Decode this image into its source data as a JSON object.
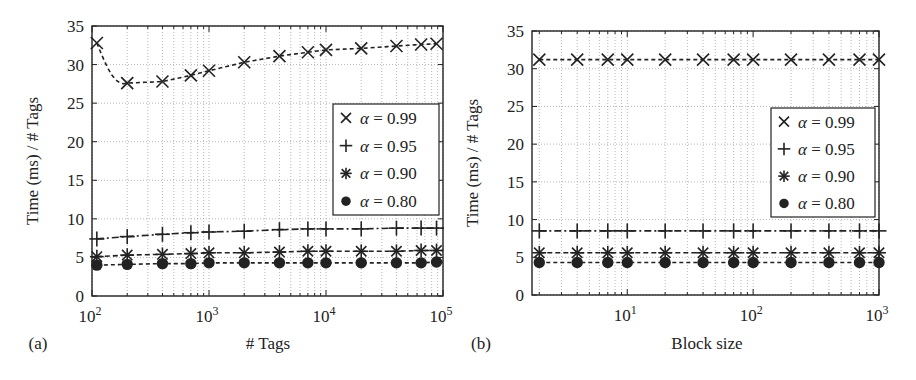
{
  "chart_data": [
    {
      "type": "line",
      "panel_label": "(a)",
      "title": "",
      "xlabel": "# Tags",
      "ylabel": "Time (ms) / # Tags",
      "xscale": "log",
      "xlim": [
        100,
        100000
      ],
      "ylim": [
        0,
        35
      ],
      "xticks": [
        100,
        1000,
        10000,
        100000
      ],
      "xtick_labels": [
        {
          "base": "10",
          "exp": "2"
        },
        {
          "base": "10",
          "exp": "3"
        },
        {
          "base": "10",
          "exp": "4"
        },
        {
          "base": "10",
          "exp": "5"
        }
      ],
      "yticks": [
        0,
        5,
        10,
        15,
        20,
        25,
        30,
        35
      ],
      "grid": true,
      "legend_position": "center-right",
      "x": [
        110,
        200,
        400,
        700,
        1000,
        2000,
        4000,
        7000,
        10000,
        20000,
        40000,
        65000,
        88000
      ],
      "series": [
        {
          "name": "α = 0.99",
          "alpha": "0.99",
          "marker": "x",
          "values": [
            32.8,
            27.6,
            27.8,
            28.6,
            29.2,
            30.3,
            31.1,
            31.6,
            31.9,
            32.1,
            32.4,
            32.6,
            32.7
          ]
        },
        {
          "name": "α = 0.95",
          "alpha": "0.95",
          "marker": "plus",
          "values": [
            7.4,
            7.7,
            8.0,
            8.2,
            8.3,
            8.4,
            8.6,
            8.7,
            8.7,
            8.7,
            8.8,
            8.8,
            8.8
          ]
        },
        {
          "name": "α = 0.90",
          "alpha": "0.90",
          "marker": "asterisk",
          "values": [
            5.1,
            5.3,
            5.4,
            5.5,
            5.6,
            5.6,
            5.7,
            5.8,
            5.8,
            5.8,
            5.8,
            5.9,
            5.9
          ]
        },
        {
          "name": "α = 0.80",
          "alpha": "0.80",
          "marker": "circle",
          "values": [
            4.0,
            4.1,
            4.2,
            4.2,
            4.3,
            4.3,
            4.3,
            4.3,
            4.3,
            4.3,
            4.3,
            4.3,
            4.4
          ]
        }
      ]
    },
    {
      "type": "line",
      "panel_label": "(b)",
      "title": "",
      "xlabel": "Block size",
      "ylabel": "Time (ms) / # Tags",
      "xscale": "log",
      "xlim": [
        1.75,
        1000
      ],
      "ylim": [
        0,
        35
      ],
      "xticks": [
        10,
        100,
        1000
      ],
      "xtick_labels": [
        {
          "base": "10",
          "exp": "1"
        },
        {
          "base": "10",
          "exp": "2"
        },
        {
          "base": "10",
          "exp": "3"
        }
      ],
      "yticks": [
        0,
        5,
        10,
        15,
        20,
        25,
        30,
        35
      ],
      "grid": true,
      "legend_position": "center-right",
      "x": [
        2,
        4,
        7,
        10,
        20,
        40,
        70,
        100,
        200,
        400,
        700,
        1000
      ],
      "series": [
        {
          "name": "α = 0.99",
          "alpha": "0.99",
          "marker": "x",
          "values": [
            31.2,
            31.2,
            31.2,
            31.2,
            31.2,
            31.2,
            31.2,
            31.2,
            31.2,
            31.2,
            31.2,
            31.2
          ]
        },
        {
          "name": "α = 0.95",
          "alpha": "0.95",
          "marker": "plus",
          "values": [
            8.5,
            8.5,
            8.5,
            8.5,
            8.5,
            8.5,
            8.5,
            8.5,
            8.5,
            8.5,
            8.5,
            8.5
          ]
        },
        {
          "name": "α = 0.90",
          "alpha": "0.90",
          "marker": "asterisk",
          "values": [
            5.6,
            5.6,
            5.6,
            5.6,
            5.6,
            5.6,
            5.6,
            5.6,
            5.6,
            5.6,
            5.6,
            5.6
          ]
        },
        {
          "name": "α = 0.80",
          "alpha": "0.80",
          "marker": "circle",
          "values": [
            4.3,
            4.3,
            4.3,
            4.3,
            4.3,
            4.3,
            4.3,
            4.3,
            4.3,
            4.3,
            4.3,
            4.3
          ]
        }
      ]
    }
  ],
  "layout": {
    "panels": [
      {
        "plot": {
          "left": 92,
          "top": 26,
          "right": 443,
          "bottom": 296
        },
        "legend": {
          "left": 333,
          "top": 104,
          "width": 106,
          "height": 111
        },
        "panel_label_pos": [
          38,
          349
        ],
        "xlabel_pos": [
          268,
          349
        ],
        "ylabel_pos": [
          38,
          161
        ]
      },
      {
        "plot": {
          "left": 532,
          "top": 31,
          "right": 879,
          "bottom": 295
        },
        "legend": {
          "left": 771,
          "top": 108,
          "width": 104,
          "height": 109
        },
        "panel_label_pos": [
          481,
          349
        ],
        "xlabel_pos": [
          707,
          349
        ],
        "ylabel_pos": [
          478,
          163
        ]
      }
    ],
    "colors": {
      "ink": "#222222",
      "grid": "#9a9a9a",
      "background": "#ffffff"
    }
  }
}
